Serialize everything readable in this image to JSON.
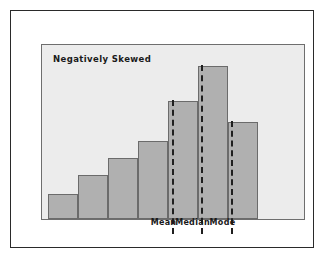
{
  "figure": {
    "title": "Negatively Skewed",
    "panel_background": "#ececec",
    "bar_fill": "#b0b0b0",
    "bar_stroke": "#6b6b6b",
    "frame_color": "#2a2a2a",
    "marker_color": "#1f1f1f"
  },
  "chart_data": {
    "type": "bar",
    "title": "Negatively Skewed",
    "xlabel": "",
    "ylabel": "",
    "grid": false,
    "legend": "none",
    "categories": [
      "1",
      "2",
      "3",
      "4",
      "5",
      "6",
      "7"
    ],
    "values": [
      24,
      42,
      58,
      74,
      112,
      145,
      92
    ],
    "ylim": [
      0,
      164
    ],
    "bar_left_px": [
      6,
      36,
      66,
      96,
      126,
      156,
      186
    ],
    "bar_width_px": 30,
    "annotations": [
      {
        "label": "Mean",
        "x_px": 130,
        "style": "dashed-vertical"
      },
      {
        "label": "Median",
        "x_px": 159,
        "style": "dashed-vertical"
      },
      {
        "label": "Mode",
        "x_px": 189,
        "style": "dashed-vertical"
      }
    ]
  },
  "markers": [
    {
      "label": "Mean"
    },
    {
      "label": "Median"
    },
    {
      "label": "Mode"
    }
  ]
}
